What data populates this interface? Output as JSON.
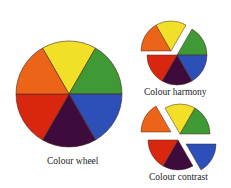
{
  "diagrams": [
    {
      "id": "wheel",
      "caption": "Colour wheel"
    },
    {
      "id": "harmony",
      "caption": "Colour harmony"
    },
    {
      "id": "contrast",
      "caption": "Colour contrast"
    }
  ],
  "colors": {
    "yellow": "#f2e028",
    "green": "#3f9a35",
    "blue": "#2d4fb8",
    "purple": "#3d0b3c",
    "red": "#d8260f",
    "orange": "#ec6418"
  }
}
